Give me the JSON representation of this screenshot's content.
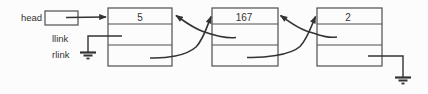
{
  "diagram": {
    "head_label": "head",
    "field_labels": {
      "llink": "llink",
      "rlink": "rlink"
    },
    "nodes": [
      {
        "value": "5"
      },
      {
        "value": "167"
      },
      {
        "value": "2"
      }
    ],
    "null_icon": "electrical-ground",
    "colors": {
      "ink": "#333333",
      "box-border": "#4f4f4f",
      "bg": "#fcfcfc"
    }
  }
}
